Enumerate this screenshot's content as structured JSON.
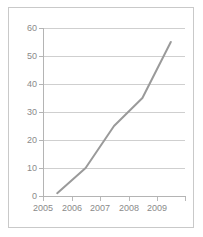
{
  "chart_data": {
    "type": "line",
    "title": "",
    "subtitle": "",
    "xlabel": "",
    "ylabel": "",
    "categories": [
      "2005",
      "2006",
      "2007",
      "2008",
      "2009"
    ],
    "x": [
      2005,
      2006,
      2007,
      2008,
      2009
    ],
    "series": [
      {
        "name": "series-1",
        "values": [
          1,
          10,
          25,
          35,
          55
        ],
        "color": "#9a9a9a"
      }
    ],
    "ylim": [
      0,
      60
    ],
    "yticks": [
      0,
      10,
      20,
      30,
      40,
      50,
      60
    ],
    "ytick_labels": [
      "0",
      "10",
      "20",
      "30",
      "40",
      "50",
      "60"
    ],
    "xtick_labels": [
      "2005",
      "2006",
      "2007",
      "2008",
      "2009"
    ],
    "grid": true,
    "grid_axis": "y",
    "legend": false,
    "legend_position": "none",
    "markers": false
  },
  "style": {
    "line_color": "#9a9a9a",
    "grid_color": "#cfcfcf",
    "axis_color": "#b4b4b4",
    "tick_label_color": "#8a8a8a",
    "frame_color": "#c9c9c9",
    "background": "#ffffff"
  }
}
